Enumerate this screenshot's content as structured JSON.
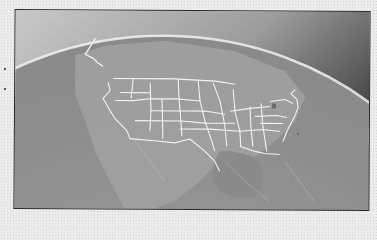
{
  "image": {
    "subject": "globe-earth-curvature-north-america",
    "description": "Grayscale view of Earth's curvature with the contiguous United States state boundaries drawn as light lines",
    "colors": {
      "paper": "#ececec",
      "frame_border": "#2a2a2a",
      "ocean": "#8c8c8c",
      "land": "#9a9a9a",
      "atmosphere_glow": "#f2f2f2",
      "space_dark": "#3c3c3c",
      "state_lines": "#f4f4f4"
    },
    "labels": []
  }
}
